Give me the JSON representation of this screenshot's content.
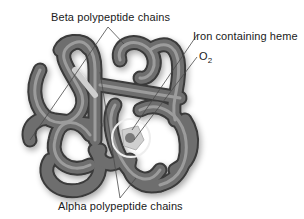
{
  "diagram": {
    "labels": {
      "beta": "Beta polypeptide chains",
      "heme": "Iron containing heme",
      "o2_main": "O",
      "o2_sub": "2",
      "alpha": "Alpha polypeptide chains"
    },
    "colors": {
      "background": "#ffffff",
      "tube_dark": "#3c3c3c",
      "tube_mid": "#6e6e6e",
      "tube_light": "#a8a8a8",
      "leader_line": "#555555",
      "heme_circle": "#e8e8e8"
    }
  }
}
